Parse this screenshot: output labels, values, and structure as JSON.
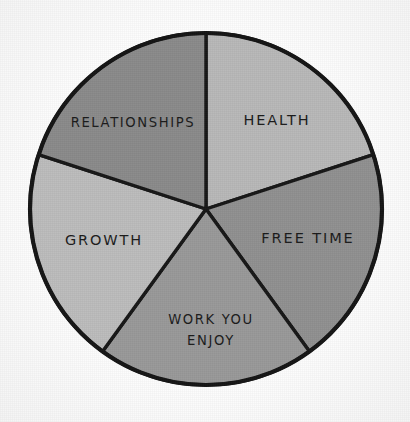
{
  "figure": {
    "name": "life-balance-pie-chart",
    "background_color": "#fdfdfd",
    "outline_color": "#141414"
  },
  "chart_data": {
    "type": "pie",
    "title": "",
    "subtitle": "",
    "xlabel": "",
    "ylabel": "",
    "legend": "none",
    "grid": false,
    "labels_inside_slices": true,
    "total": 100,
    "categories": [
      "HEALTH",
      "FREE TIME",
      "WORK YOU ENJOY",
      "GROWTH",
      "RELATIONSHIPS"
    ],
    "values": [
      20,
      20,
      20,
      20,
      20
    ],
    "colors": [
      "#b8b8b8",
      "#909090",
      "#999999",
      "#bcbcbc",
      "#8a8a8a"
    ],
    "slices": [
      {
        "label": "HEALTH",
        "label_lines": [
          "HEALTH"
        ],
        "value": 20,
        "percent": "20%",
        "color": "#b8b8b8",
        "start_angle_deg": 0,
        "end_angle_deg": 72
      },
      {
        "label": "FREE TIME",
        "label_lines": [
          "FREE TIME"
        ],
        "value": 20,
        "percent": "20%",
        "color": "#909090",
        "start_angle_deg": 72,
        "end_angle_deg": 144
      },
      {
        "label": "WORK YOU ENJOY",
        "label_lines": [
          "WORK YOU",
          "ENJOY"
        ],
        "value": 20,
        "percent": "20%",
        "color": "#999999",
        "start_angle_deg": 144,
        "end_angle_deg": 216
      },
      {
        "label": "GROWTH",
        "label_lines": [
          "GROWTH"
        ],
        "value": 20,
        "percent": "20%",
        "color": "#bcbcbc",
        "start_angle_deg": 216,
        "end_angle_deg": 288
      },
      {
        "label": "RELATIONSHIPS",
        "label_lines": [
          "RELATIONSHIPS"
        ],
        "value": 20,
        "percent": "20%",
        "color": "#8a8a8a",
        "start_angle_deg": 288,
        "end_angle_deg": 360
      }
    ]
  }
}
